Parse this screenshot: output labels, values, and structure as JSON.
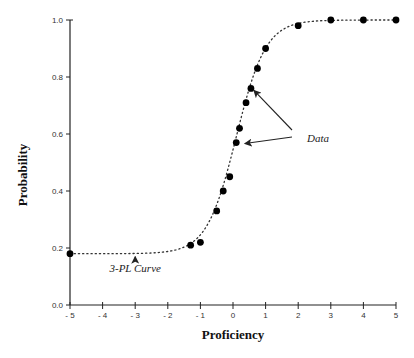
{
  "chart_data": {
    "type": "scatter",
    "title": "",
    "xlabel": "Proficiency",
    "ylabel": "Probability",
    "xlim": [
      -5,
      5
    ],
    "ylim": [
      0.0,
      1.0
    ],
    "x_ticks": [
      -5,
      -4,
      -3,
      -2,
      -1,
      0,
      1,
      2,
      3,
      4,
      5
    ],
    "x_tick_labels": [
      "- 5",
      "- 4",
      "- 3",
      "- 2",
      "- 1",
      "0",
      "1",
      "2",
      "3",
      "4",
      "5"
    ],
    "y_ticks": [
      0.0,
      0.2,
      0.4,
      0.6,
      0.8,
      1.0
    ],
    "y_tick_labels": [
      "0.0",
      "0.2",
      "0.4",
      "0.6",
      "0.8",
      "1.0"
    ],
    "grid": false,
    "legend": null,
    "series": [
      {
        "name": "Data",
        "type": "scatter",
        "points": [
          {
            "x": -5.0,
            "y": 0.18
          },
          {
            "x": -1.3,
            "y": 0.21
          },
          {
            "x": -1.0,
            "y": 0.22
          },
          {
            "x": -0.5,
            "y": 0.33
          },
          {
            "x": -0.3,
            "y": 0.4
          },
          {
            "x": -0.1,
            "y": 0.45
          },
          {
            "x": 0.1,
            "y": 0.57
          },
          {
            "x": 0.2,
            "y": 0.62
          },
          {
            "x": 0.4,
            "y": 0.71
          },
          {
            "x": 0.55,
            "y": 0.76
          },
          {
            "x": 0.75,
            "y": 0.83
          },
          {
            "x": 1.0,
            "y": 0.9
          },
          {
            "x": 2.0,
            "y": 0.98
          },
          {
            "x": 3.0,
            "y": 1.0
          },
          {
            "x": 4.0,
            "y": 1.0
          },
          {
            "x": 5.0,
            "y": 1.0
          }
        ]
      },
      {
        "name": "3-PL Curve",
        "type": "line",
        "style": "dotted",
        "model": {
          "c": 0.18,
          "a": 1.3,
          "b": 0.1,
          "D": 1.7
        }
      }
    ],
    "annotations": [
      {
        "text": "Data",
        "x": 1.35,
        "y": 0.65,
        "arrows_to": [
          {
            "x": 0.55,
            "y": 0.76
          },
          {
            "x": 0.15,
            "y": 0.57
          }
        ]
      },
      {
        "text": "3-PL Curve",
        "x": -3.0,
        "y": 0.1,
        "arrows_to": [
          {
            "x": -3.0,
            "y": 0.18
          }
        ]
      }
    ]
  },
  "labels": {
    "xlabel": "Proficiency",
    "ylabel": "Probability",
    "annot_data": "Data",
    "annot_curve": "3-PL Curve"
  },
  "colors": {
    "axis": "#222222",
    "points": "#000000",
    "curve": "#333333",
    "background": "#ffffff"
  }
}
